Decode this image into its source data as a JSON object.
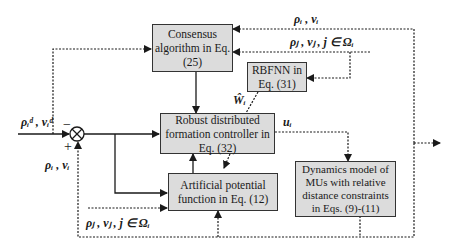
{
  "diagram": {
    "colors": {
      "box_fill": "#dcdcdc",
      "box_border": "#333333",
      "line": "#1a1a1a",
      "background": "#ffffff"
    },
    "blocks": {
      "consensus": {
        "label": "Consensus\nalgorithm in Eq.\n(25)"
      },
      "rbfnn": {
        "label": "RBFNN in\nEq. (31)"
      },
      "controller": {
        "label": "Robust distributed\nformation controller in\nEq. (32)"
      },
      "potential": {
        "label": "Artificial potential\nfunction in Eq. (12)"
      },
      "dynamics": {
        "label": "Dynamics model of\nMUs with relative\ndistance constraints\nin Eqs. (9)-(11)"
      }
    },
    "summing_junction": {
      "symbol": "⊗",
      "minus_sign": "−",
      "plus_sign": "+"
    },
    "signals": {
      "reference": "ρᵢᵈ , vᵢᵈ",
      "feedback_self_left": "ρᵢ , vᵢ",
      "feedback_self_top": "ρᵢ , vᵢ",
      "neighbors_top": "ρⱼ , vⱼ , j ∈ Ωᵢ",
      "neighbors_bottom": "ρⱼ , vⱼ , j ∈ Ωᵢ",
      "nn_weight": "Ŵᵢ",
      "control_input": "uᵢ"
    }
  }
}
